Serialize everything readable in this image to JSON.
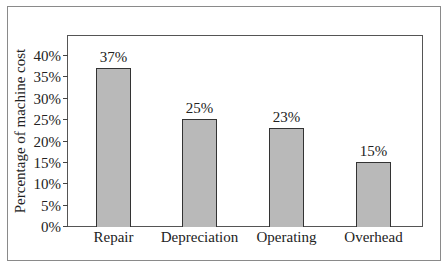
{
  "chart_data": {
    "type": "bar",
    "title": "",
    "xlabel": "",
    "ylabel": "Percentage of machine cost",
    "categories": [
      "Repair",
      "Depreciation",
      "Operating",
      "Overhead"
    ],
    "values": [
      37,
      25,
      23,
      15
    ],
    "value_labels": [
      "37%",
      "25%",
      "23%",
      "15%"
    ],
    "ylim": [
      0,
      40
    ],
    "yticks": [
      "0%",
      "5%",
      "10%",
      "15%",
      "20%",
      "25%",
      "30%",
      "35%",
      "40%"
    ],
    "grid": false,
    "legend": null,
    "bar_color": "#b9b9b9"
  }
}
